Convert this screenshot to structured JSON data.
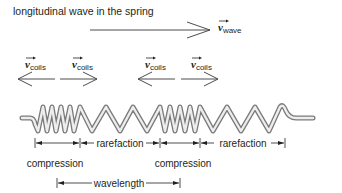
{
  "title": "longitudinal wave in the spring",
  "wave_velocity": {
    "symbol": "v",
    "subscript": "wave",
    "direction": "right"
  },
  "coil_velocities": [
    {
      "symbol": "v",
      "subscript": "coils",
      "direction": "left"
    },
    {
      "symbol": "v",
      "subscript": "coils",
      "direction": "right"
    },
    {
      "symbol": "v",
      "subscript": "coils",
      "direction": "left"
    },
    {
      "symbol": "v",
      "subscript": "coils",
      "direction": "right"
    }
  ],
  "regions": [
    {
      "label": "compression",
      "type": "compression"
    },
    {
      "label": "rarefaction",
      "type": "rarefaction"
    },
    {
      "label": "compression",
      "type": "compression"
    },
    {
      "label": "rarefaction",
      "type": "rarefaction"
    }
  ],
  "wavelength_label": "wavelength",
  "colors": {
    "line": "#4d4d4d",
    "text": "#231f20",
    "spring_light": "#f2f2f2",
    "spring_dark": "#8c8c8c"
  }
}
